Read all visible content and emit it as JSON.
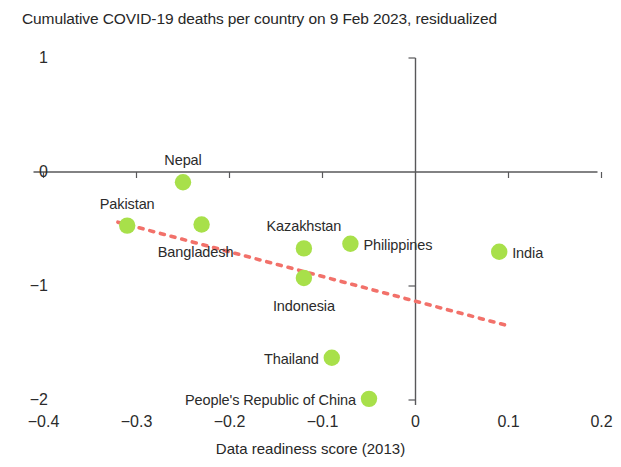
{
  "chart_data": {
    "type": "scatter",
    "title": "Cumulative COVID-19 deaths per country on 9 Feb 2023, residualized",
    "xlabel": "Data readiness score (2013)",
    "ylabel": "",
    "xlim": [
      -0.4,
      0.2
    ],
    "ylim": [
      -2,
      1
    ],
    "xticks": [
      "-0.4",
      "-0.3",
      "-0.2",
      "-0.1",
      "0",
      "0.1",
      "0.2"
    ],
    "xtick_values": [
      -0.4,
      -0.3,
      -0.2,
      -0.1,
      0,
      0.1,
      0.2
    ],
    "yticks": [
      "1",
      "0",
      "-1",
      "-2"
    ],
    "ytick_values": [
      1,
      0,
      -1,
      -2
    ],
    "grid": false,
    "legend": "none",
    "marker_color": "#a8e04a",
    "trendline_color": "#f2716a",
    "axis_color": "#58585a",
    "points": [
      {
        "label": "Nepal",
        "x": -0.25,
        "y": -0.09,
        "label_pos": "above"
      },
      {
        "label": "Pakistan",
        "x": -0.31,
        "y": -0.47,
        "label_pos": "above"
      },
      {
        "label": "Bangladesh",
        "x": -0.23,
        "y": -0.46,
        "label_pos": "below-left"
      },
      {
        "label": "Kazakhstan",
        "x": -0.12,
        "y": -0.67,
        "label_pos": "above"
      },
      {
        "label": "Philippines",
        "x": -0.07,
        "y": -0.63,
        "label_pos": "right"
      },
      {
        "label": "Indonesia",
        "x": -0.12,
        "y": -0.93,
        "label_pos": "below"
      },
      {
        "label": "India",
        "x": 0.09,
        "y": -0.7,
        "label_pos": "right"
      },
      {
        "label": "Thailand",
        "x": -0.09,
        "y": -1.63,
        "label_pos": "left"
      },
      {
        "label": "People's Republic of China",
        "x": -0.05,
        "y": -1.99,
        "label_pos": "left"
      }
    ],
    "trendline": {
      "x0": -0.32,
      "y0": -0.44,
      "x1": 0.1,
      "y1": -1.35
    }
  }
}
